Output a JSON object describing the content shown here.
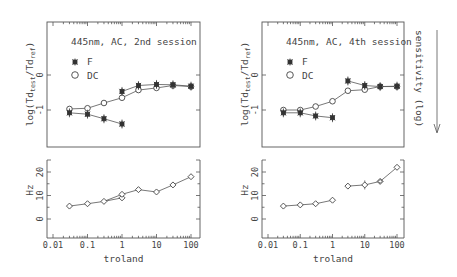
{
  "chart_data": [
    {
      "type": "line",
      "panel": "top-left",
      "title": "445nm, AC, 2nd session",
      "xlabel": "",
      "ylabel": "log(Td_test/Td_ref)",
      "xscale": "log",
      "xlim": [
        0.01,
        100
      ],
      "ylim": [
        -1.7,
        0.5
      ],
      "yticks": [
        "0",
        "-1"
      ],
      "x": [
        0.03,
        0.1,
        0.3,
        1,
        3,
        10,
        30,
        100
      ],
      "series": [
        {
          "name": "F",
          "marker": "asterisk",
          "segments": [
            {
              "x": [
                0.03,
                0.1,
                0.3,
                1
              ],
              "values": [
                -1.08,
                -1.12,
                -1.25,
                -1.4
              ]
            },
            {
              "x": [
                1,
                3,
                10,
                30,
                100
              ],
              "values": [
                -0.47,
                -0.3,
                -0.27,
                -0.28,
                -0.32
              ]
            }
          ]
        },
        {
          "name": "DC",
          "marker": "circle",
          "values": [
            -0.97,
            -0.95,
            -0.8,
            -0.65,
            -0.43,
            -0.37,
            -0.3,
            -0.33
          ]
        }
      ],
      "legend": [
        "F",
        "DC"
      ]
    },
    {
      "type": "line",
      "panel": "top-right",
      "title": "445nm, AC, 4th session",
      "xlabel": "",
      "ylabel": "log(Td_test/Td_ref)",
      "xscale": "log",
      "xlim": [
        0.01,
        100
      ],
      "ylim": [
        -1.7,
        0.5
      ],
      "yticks": [
        "0",
        "-1"
      ],
      "x": [
        0.03,
        0.1,
        0.3,
        1,
        3,
        10,
        30,
        100
      ],
      "series": [
        {
          "name": "F",
          "marker": "asterisk",
          "segments": [
            {
              "x": [
                0.03,
                0.1,
                0.3,
                1
              ],
              "values": [
                -1.08,
                -1.08,
                -1.17,
                -1.22
              ]
            },
            {
              "x": [
                3,
                10,
                30,
                100
              ],
              "values": [
                -0.17,
                -0.3,
                -0.33,
                -0.32
              ]
            }
          ]
        },
        {
          "name": "DC",
          "marker": "circle",
          "values": [
            -1.0,
            -1.0,
            -0.9,
            -0.75,
            -0.45,
            -0.42,
            -0.33,
            -0.33
          ]
        }
      ],
      "legend": [
        "F",
        "DC"
      ],
      "annotation": "sensitivity (log)"
    },
    {
      "type": "line",
      "panel": "bottom-left",
      "xlabel": "troland",
      "ylabel": "Hz",
      "xscale": "log",
      "xlim": [
        0.01,
        100
      ],
      "ylim": [
        -7,
        25
      ],
      "yticks": [
        "0",
        "10",
        "20"
      ],
      "xticks": [
        "0.01",
        "0.1",
        "1",
        "10",
        "100"
      ],
      "x": [
        0.03,
        0.1,
        0.3,
        1,
        1,
        3,
        10,
        30,
        100
      ],
      "series": [
        {
          "name": "Hz",
          "marker": "diamond",
          "values": [
            5.5,
            6.5,
            7.5,
            9,
            10.5,
            12.5,
            11.5,
            14.5,
            18
          ]
        }
      ]
    },
    {
      "type": "line",
      "panel": "bottom-right",
      "xlabel": "troland",
      "ylabel": "Hz",
      "xscale": "log",
      "xlim": [
        0.01,
        100
      ],
      "ylim": [
        -7,
        25
      ],
      "yticks": [
        "0",
        "10",
        "20"
      ],
      "xticks": [
        "0.01",
        "0.1",
        "1",
        "10",
        "100"
      ],
      "x": [
        0.03,
        0.1,
        0.3,
        1,
        3,
        10,
        30,
        100
      ],
      "series": [
        {
          "name": "Hz",
          "marker": "diamond",
          "segments": [
            {
              "x": [
                0.03,
                0.1,
                0.3,
                1
              ],
              "values": [
                5.5,
                6,
                6.5,
                8
              ]
            },
            {
              "x": [
                3,
                10,
                30,
                100
              ],
              "values": [
                14,
                14.5,
                16,
                22
              ]
            }
          ]
        }
      ]
    }
  ],
  "labels": {
    "left_title": "445nm, AC, 2nd session",
    "right_title": "445nm, AC, 4th session",
    "legend_f": "F",
    "legend_dc": "DC",
    "ylabel_top": "log(Td",
    "ylabel_sub_test": "test",
    "ylabel_mid": "/Td",
    "ylabel_sub_ref": "ref",
    "ylabel_end": ")",
    "ylabel_bottom": "Hz",
    "xlabel": "troland",
    "sensitivity": "sensitivity (log)",
    "ytick_0": "0",
    "ytick_m1": "-1",
    "ytick_hz0": "0",
    "ytick_hz10": "10",
    "ytick_hz20": "20",
    "xtick_001": "0.01",
    "xtick_01": "0.1",
    "xtick_1": "1",
    "xtick_10": "10",
    "xtick_100": "100"
  }
}
